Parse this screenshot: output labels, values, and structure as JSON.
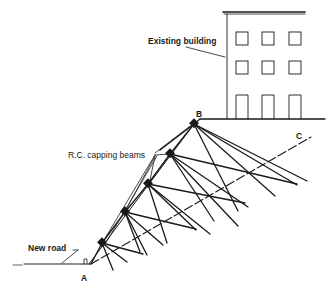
{
  "diagram": {
    "labels": {
      "building": "Existing building",
      "beams": "R.C. capping beams",
      "road": "New road",
      "point_a": "A",
      "point_b": "B",
      "point_c": "C"
    },
    "colors": {
      "ink": "#1a1a1a",
      "background": "#ffffff"
    }
  }
}
